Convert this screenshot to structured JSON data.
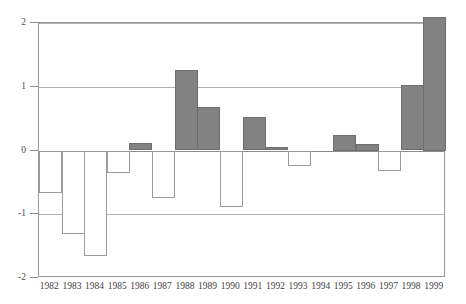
{
  "chart_data": {
    "type": "bar",
    "title": "",
    "subtitle": "",
    "xlabel": "",
    "ylabel": "",
    "categories": [
      "1982",
      "1983",
      "1984",
      "1985",
      "1986",
      "1987",
      "1988",
      "1989",
      "1990",
      "1991",
      "1992",
      "1993",
      "1994",
      "1995",
      "1996",
      "1997",
      "1998",
      "1999"
    ],
    "values": [
      -0.66,
      -1.31,
      -1.66,
      -0.35,
      0.12,
      -0.74,
      1.26,
      0.68,
      -0.89,
      0.52,
      0.06,
      -0.25,
      0.0,
      0.25,
      0.1,
      -0.32,
      1.02,
      2.1
    ],
    "ylim": [
      -2,
      2
    ],
    "yticks": [
      2,
      1,
      0,
      -1,
      -2
    ],
    "ytick_labels": [
      "2",
      "1",
      "0",
      "-1",
      "-2"
    ],
    "grid": true,
    "gridlines_at": [
      2,
      1,
      0,
      -1
    ],
    "legend": null,
    "legend_position": "none",
    "series": [
      {
        "name": "value",
        "values": [
          -0.66,
          -1.31,
          -1.66,
          -0.35,
          0.12,
          -0.74,
          1.26,
          0.68,
          -0.89,
          0.52,
          0.06,
          -0.25,
          0.0,
          0.25,
          0.1,
          -0.32,
          1.02,
          2.1
        ]
      }
    ],
    "style": {
      "positive_fill": "#828282",
      "positive_stroke": "#6e6e6e",
      "negative_fill": "#ffffff",
      "negative_stroke": "#9c9c9c",
      "grid_color": "#b0b0b0",
      "zero_line_color": "#8c8c8c",
      "axis_color": "#9a9a9a",
      "background": "#ffffff",
      "text_color": "#3f3f3f"
    },
    "annotations": []
  }
}
